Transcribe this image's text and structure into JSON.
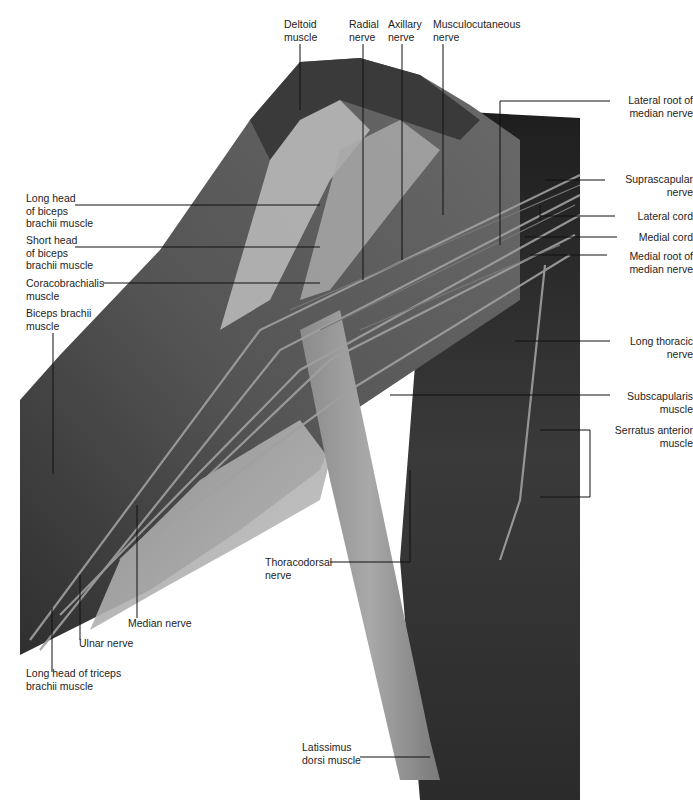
{
  "figure": {
    "caption_clipped": "",
    "colors": {
      "background": "#ffffff",
      "leader_line": "#111111",
      "text": "#1d1d1d",
      "muscle_dark": "#3c3c3c",
      "muscle_mid": "#6e6e6e",
      "tendon_light": "#b8b8b8",
      "chest_wall": "#2e2e2e"
    },
    "labels": {
      "deltoid": [
        "Deltoid",
        "muscle"
      ],
      "radial": [
        "Radial",
        "nerve"
      ],
      "axillary": [
        "Axillary",
        "nerve"
      ],
      "musculocutaneous": [
        "Musculocutaneous",
        "nerve"
      ],
      "lateral_root": [
        "Lateral root of",
        "median nerve"
      ],
      "suprascapular": [
        "Suprascapular",
        "nerve"
      ],
      "lateral_cord": [
        "Lateral cord"
      ],
      "medial_cord": [
        "Medial cord"
      ],
      "medial_root": [
        "Medial root of",
        "median nerve"
      ],
      "long_thoracic": [
        "Long thoracic",
        "nerve"
      ],
      "subscapularis": [
        "Subscapularis",
        "muscle"
      ],
      "serratus": [
        "Serratus anterior",
        "muscle"
      ],
      "long_head_biceps": [
        "Long head",
        "of biceps",
        "brachii muscle"
      ],
      "short_head_biceps": [
        "Short head",
        "of biceps",
        "brachii muscle"
      ],
      "coracobrachialis": [
        "Coracobrachialis",
        "muscle"
      ],
      "biceps_brachii": [
        "Biceps brachii",
        "muscle"
      ],
      "thoracodorsal": [
        "Thoracodorsal",
        "nerve"
      ],
      "median": [
        "Median nerve"
      ],
      "ulnar": [
        "Ulnar nerve"
      ],
      "long_head_triceps": [
        "Long head of triceps",
        "brachii muscle"
      ],
      "latissimus": [
        "Latissimus",
        "dorsi muscle"
      ]
    }
  }
}
